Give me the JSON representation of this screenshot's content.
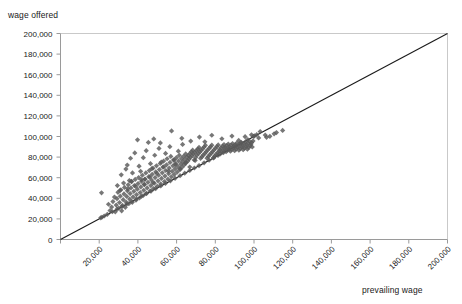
{
  "chart_data": {
    "type": "scatter",
    "title": "",
    "xlabel": "prevailing wage",
    "ylabel": "wage offered",
    "xlim": [
      0,
      200000
    ],
    "ylim": [
      0,
      200000
    ],
    "grid": false,
    "legend": null,
    "marker": {
      "shape": "diamond",
      "color": "#595959",
      "size": 4
    },
    "reference_line": {
      "name": "identity-line",
      "description": "45 degree line where wage offered equals prevailing wage",
      "from": [
        0,
        0
      ],
      "to": [
        200000,
        200000
      ],
      "color": "#1a1a1a"
    },
    "xticks": [
      0,
      20000,
      40000,
      60000,
      80000,
      100000,
      120000,
      140000,
      160000,
      180000,
      200000
    ],
    "xticklabels": [
      "",
      "20,000",
      "40,000",
      "60,000",
      "80,000",
      "100,000",
      "120,000",
      "140,000",
      "160,000",
      "180,000",
      "200,000"
    ],
    "xtick_rotation": 45,
    "yticks": [
      0,
      20000,
      40000,
      60000,
      80000,
      100000,
      120000,
      140000,
      160000,
      180000,
      200000
    ],
    "yticklabels": [
      "0",
      "20,000",
      "40,000",
      "60,000",
      "80,000",
      "100,000",
      "120,000",
      "140,000",
      "160,000",
      "180,000",
      "200,000"
    ],
    "points": [
      [
        21200,
        45300
      ],
      [
        24800,
        34200
      ],
      [
        25600,
        28100
      ],
      [
        26400,
        31500
      ],
      [
        27100,
        36800
      ],
      [
        27900,
        41200
      ],
      [
        28300,
        26900
      ],
      [
        28800,
        33400
      ],
      [
        29200,
        39600
      ],
      [
        29700,
        45800
      ],
      [
        30100,
        30500
      ],
      [
        30500,
        35900
      ],
      [
        30900,
        42100
      ],
      [
        31200,
        48300
      ],
      [
        31600,
        27800
      ],
      [
        32000,
        33100
      ],
      [
        32400,
        38700
      ],
      [
        32800,
        44200
      ],
      [
        33100,
        50600
      ],
      [
        33500,
        31200
      ],
      [
        33900,
        36400
      ],
      [
        34200,
        41800
      ],
      [
        34600,
        47300
      ],
      [
        35000,
        53100
      ],
      [
        35300,
        34700
      ],
      [
        35700,
        39200
      ],
      [
        36000,
        44600
      ],
      [
        36400,
        50100
      ],
      [
        36800,
        56200
      ],
      [
        37100,
        36100
      ],
      [
        37500,
        41300
      ],
      [
        37900,
        46800
      ],
      [
        38200,
        52400
      ],
      [
        38600,
        58300
      ],
      [
        39000,
        38200
      ],
      [
        39300,
        43500
      ],
      [
        39700,
        48900
      ],
      [
        40100,
        54300
      ],
      [
        40400,
        60100
      ],
      [
        40800,
        40300
      ],
      [
        41200,
        45600
      ],
      [
        41500,
        51000
      ],
      [
        41900,
        56500
      ],
      [
        42300,
        62400
      ],
      [
        42600,
        42500
      ],
      [
        43000,
        47800
      ],
      [
        43400,
        53200
      ],
      [
        43700,
        58700
      ],
      [
        44100,
        64600
      ],
      [
        44500,
        44800
      ],
      [
        44800,
        50100
      ],
      [
        45200,
        55500
      ],
      [
        45600,
        61000
      ],
      [
        45900,
        66900
      ],
      [
        46300,
        47100
      ],
      [
        46700,
        52400
      ],
      [
        47000,
        57800
      ],
      [
        47400,
        63300
      ],
      [
        47800,
        69200
      ],
      [
        48100,
        49400
      ],
      [
        48500,
        54700
      ],
      [
        48900,
        60100
      ],
      [
        49200,
        65600
      ],
      [
        49600,
        71500
      ],
      [
        50000,
        51700
      ],
      [
        50400,
        57000
      ],
      [
        50700,
        62400
      ],
      [
        51100,
        67900
      ],
      [
        51500,
        73800
      ],
      [
        51800,
        54000
      ],
      [
        52200,
        59300
      ],
      [
        52600,
        64700
      ],
      [
        52900,
        70200
      ],
      [
        53300,
        76100
      ],
      [
        53700,
        56300
      ],
      [
        54000,
        61600
      ],
      [
        54400,
        67000
      ],
      [
        54800,
        72500
      ],
      [
        55100,
        78400
      ],
      [
        55500,
        58600
      ],
      [
        55900,
        63900
      ],
      [
        56200,
        69300
      ],
      [
        56600,
        74800
      ],
      [
        57000,
        80700
      ],
      [
        57300,
        60900
      ],
      [
        57700,
        66200
      ],
      [
        58100,
        71600
      ],
      [
        58400,
        77100
      ],
      [
        58800,
        63200
      ],
      [
        59200,
        68500
      ],
      [
        59500,
        73900
      ],
      [
        59900,
        79400
      ],
      [
        60300,
        65500
      ],
      [
        60600,
        70800
      ],
      [
        61000,
        76200
      ],
      [
        61400,
        81700
      ],
      [
        61700,
        67800
      ],
      [
        62100,
        73100
      ],
      [
        62500,
        78500
      ],
      [
        62800,
        70100
      ],
      [
        63200,
        75400
      ],
      [
        63600,
        80800
      ],
      [
        63900,
        72400
      ],
      [
        64300,
        77700
      ],
      [
        64700,
        83100
      ],
      [
        65000,
        74700
      ],
      [
        65400,
        80000
      ],
      [
        65800,
        76300
      ],
      [
        66100,
        81600
      ],
      [
        66500,
        78200
      ],
      [
        66900,
        83500
      ],
      [
        67200,
        79800
      ],
      [
        67600,
        85100
      ],
      [
        68000,
        81400
      ],
      [
        68300,
        86700
      ],
      [
        68700,
        83000
      ],
      [
        69100,
        77200
      ],
      [
        69400,
        84600
      ],
      [
        69800,
        79500
      ],
      [
        70200,
        86200
      ],
      [
        70500,
        81800
      ],
      [
        70900,
        87800
      ],
      [
        71300,
        83400
      ],
      [
        71600,
        89400
      ],
      [
        72000,
        85000
      ],
      [
        72400,
        78800
      ],
      [
        72700,
        86600
      ],
      [
        73100,
        80400
      ],
      [
        73500,
        88200
      ],
      [
        73800,
        82000
      ],
      [
        74200,
        89800
      ],
      [
        74600,
        83600
      ],
      [
        74900,
        91400
      ],
      [
        75300,
        85200
      ],
      [
        75700,
        79000
      ],
      [
        76000,
        86800
      ],
      [
        76400,
        80600
      ],
      [
        76800,
        88400
      ],
      [
        77100,
        82200
      ],
      [
        77500,
        90000
      ],
      [
        77900,
        83800
      ],
      [
        78200,
        91600
      ],
      [
        78600,
        85400
      ],
      [
        79000,
        79200
      ],
      [
        79300,
        87000
      ],
      [
        79700,
        81000
      ],
      [
        80100,
        88600
      ],
      [
        80400,
        82600
      ],
      [
        80800,
        90200
      ],
      [
        81200,
        84200
      ],
      [
        81500,
        91800
      ],
      [
        81900,
        85800
      ],
      [
        82300,
        87400
      ],
      [
        82600,
        83100
      ],
      [
        83000,
        89000
      ],
      [
        83400,
        84700
      ],
      [
        83700,
        90600
      ],
      [
        84100,
        86300
      ],
      [
        84500,
        92200
      ],
      [
        84800,
        87900
      ],
      [
        85200,
        89500
      ],
      [
        85600,
        85200
      ],
      [
        85900,
        91100
      ],
      [
        86300,
        86800
      ],
      [
        86700,
        92700
      ],
      [
        87000,
        88400
      ],
      [
        87400,
        90000
      ],
      [
        87800,
        85700
      ],
      [
        88100,
        91600
      ],
      [
        88500,
        87300
      ],
      [
        88900,
        93200
      ],
      [
        89200,
        88900
      ],
      [
        89600,
        90500
      ],
      [
        90000,
        86200
      ],
      [
        90300,
        92100
      ],
      [
        90700,
        87800
      ],
      [
        91100,
        93700
      ],
      [
        91400,
        89400
      ],
      [
        91800,
        91000
      ],
      [
        92200,
        86700
      ],
      [
        92500,
        92600
      ],
      [
        92900,
        88300
      ],
      [
        93300,
        94200
      ],
      [
        93600,
        89900
      ],
      [
        94000,
        91500
      ],
      [
        94400,
        87200
      ],
      [
        94700,
        93100
      ],
      [
        95100,
        88800
      ],
      [
        95500,
        94700
      ],
      [
        95800,
        90400
      ],
      [
        96200,
        92000
      ],
      [
        96600,
        87700
      ],
      [
        96900,
        93600
      ],
      [
        97300,
        89300
      ],
      [
        97700,
        95200
      ],
      [
        98000,
        90900
      ],
      [
        98400,
        92500
      ],
      [
        98800,
        94100
      ],
      [
        99100,
        89800
      ],
      [
        99500,
        95700
      ],
      [
        34500,
        72300
      ],
      [
        36200,
        78900
      ],
      [
        38400,
        84100
      ],
      [
        40600,
        71200
      ],
      [
        42800,
        79400
      ],
      [
        44300,
        86200
      ],
      [
        46500,
        73600
      ],
      [
        48700,
        81800
      ],
      [
        50900,
        88400
      ],
      [
        52100,
        75200
      ],
      [
        54300,
        83600
      ],
      [
        56500,
        90100
      ],
      [
        58700,
        77400
      ],
      [
        60900,
        85800
      ],
      [
        63100,
        92300
      ],
      [
        39800,
        96800
      ],
      [
        45400,
        94200
      ],
      [
        48200,
        97600
      ],
      [
        51600,
        93800
      ],
      [
        57400,
        105400
      ],
      [
        62700,
        98200
      ],
      [
        67300,
        95600
      ],
      [
        71800,
        99400
      ],
      [
        74600,
        94800
      ],
      [
        78200,
        101200
      ],
      [
        83400,
        97800
      ],
      [
        88600,
        100400
      ],
      [
        92100,
        96200
      ],
      [
        95400,
        99800
      ],
      [
        98700,
        101600
      ],
      [
        103200,
        104800
      ],
      [
        106500,
        99200
      ],
      [
        110400,
        102600
      ],
      [
        114800,
        105900
      ],
      [
        102400,
        98600
      ],
      [
        105800,
        101400
      ],
      [
        108200,
        100200
      ],
      [
        111600,
        103800
      ],
      [
        31400,
        62800
      ],
      [
        33800,
        68400
      ],
      [
        35600,
        57200
      ],
      [
        37200,
        64600
      ],
      [
        41400,
        66200
      ],
      [
        43600,
        58400
      ],
      [
        47200,
        68800
      ],
      [
        49800,
        64200
      ],
      [
        53400,
        70600
      ],
      [
        55800,
        66400
      ],
      [
        59400,
        72800
      ],
      [
        61800,
        68600
      ],
      [
        64600,
        74200
      ],
      [
        66800,
        70400
      ],
      [
        69600,
        76800
      ],
      [
        29400,
        52400
      ],
      [
        30800,
        47600
      ],
      [
        32600,
        54800
      ],
      [
        34800,
        49200
      ],
      [
        36600,
        56400
      ],
      [
        38800,
        51800
      ],
      [
        41800,
        58200
      ],
      [
        43200,
        53600
      ],
      [
        46200,
        60800
      ],
      [
        47800,
        55200
      ],
      [
        100200,
        100600
      ],
      [
        101400,
        101800
      ],
      [
        99800,
        100100
      ],
      [
        96800,
        97100
      ],
      [
        93600,
        93900
      ],
      [
        90400,
        90700
      ],
      [
        87200,
        87500
      ],
      [
        84200,
        84400
      ],
      [
        81400,
        81600
      ],
      [
        79200,
        79400
      ],
      [
        76800,
        77000
      ],
      [
        74200,
        74400
      ],
      [
        71600,
        71800
      ],
      [
        69200,
        69400
      ],
      [
        66800,
        67000
      ],
      [
        64200,
        64400
      ],
      [
        61800,
        62000
      ],
      [
        59200,
        59400
      ],
      [
        56800,
        57000
      ],
      [
        54200,
        54400
      ],
      [
        51800,
        52000
      ],
      [
        49200,
        49400
      ],
      [
        46800,
        47000
      ],
      [
        44200,
        44400
      ],
      [
        41800,
        42000
      ],
      [
        39200,
        39400
      ],
      [
        36800,
        37000
      ],
      [
        34200,
        34400
      ],
      [
        31800,
        32000
      ],
      [
        29200,
        29400
      ],
      [
        26800,
        27000
      ],
      [
        24200,
        24400
      ],
      [
        22600,
        22800
      ],
      [
        21400,
        21600
      ],
      [
        20800,
        21000
      ]
    ]
  }
}
